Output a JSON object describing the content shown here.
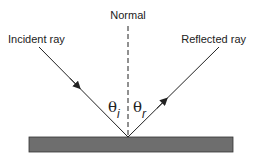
{
  "diagram": {
    "normal_label": "Normal",
    "incident_label": "Incident ray",
    "reflected_label": "Reflected ray",
    "angle_incidence": {
      "symbol": "θ",
      "subscript": "i"
    },
    "angle_reflection": {
      "symbol": "θ",
      "subscript": "r"
    },
    "colors": {
      "line": "#222222",
      "surface": "#6e6e6e",
      "surface_border": "#333333"
    }
  }
}
